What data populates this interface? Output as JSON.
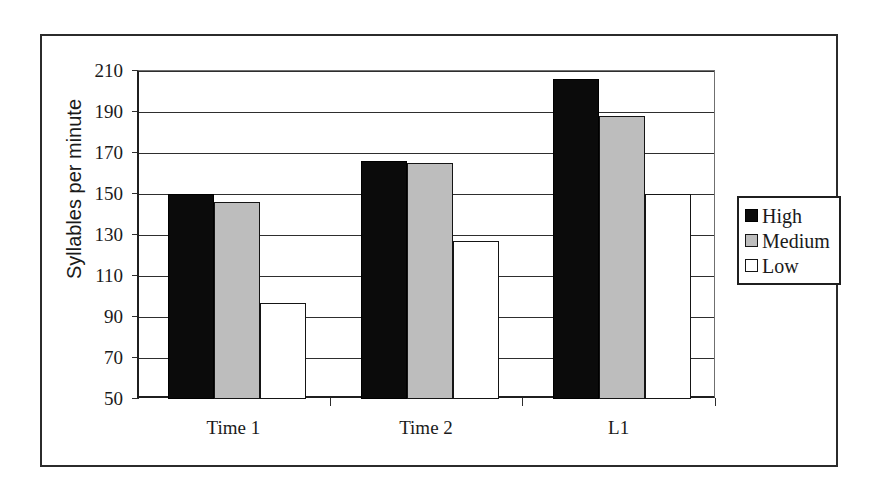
{
  "chart_data": {
    "type": "bar",
    "title": "",
    "xlabel": "",
    "ylabel": "Syllables per minute",
    "categories": [
      "Time 1",
      "Time 2",
      "L1"
    ],
    "series": [
      {
        "name": "High",
        "color": "#0b0b0b",
        "values": [
          150,
          166,
          206
        ]
      },
      {
        "name": "Medium",
        "color": "#bdbdbd",
        "values": [
          146,
          165,
          188
        ]
      },
      {
        "name": "Low",
        "color": "#ffffff",
        "values": [
          97,
          127,
          150
        ]
      }
    ],
    "ylim": [
      50,
      210
    ],
    "ytick_values": [
      50,
      70,
      90,
      110,
      130,
      150,
      170,
      190,
      210
    ],
    "ytick_labels": [
      "50",
      "70",
      "90",
      "110",
      "130",
      "150",
      "170",
      "190",
      "210"
    ],
    "grid": true,
    "legend_position": "right",
    "legend_entries": [
      "High",
      "Medium",
      "Low"
    ]
  }
}
